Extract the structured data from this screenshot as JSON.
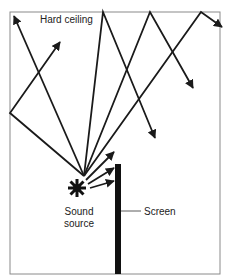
{
  "diagram": {
    "labels": {
      "ceiling": "Hard ceiling",
      "source_line1": "Sound",
      "source_line2": "source",
      "screen": "Screen"
    },
    "elements": {
      "room_box": {
        "x": 10,
        "y": 12,
        "w": 210,
        "h": 262
      },
      "screen_bar": {
        "x": 115,
        "y": 164,
        "w": 6,
        "h": 110
      },
      "sound_source": {
        "cx": 77,
        "cy": 188
      },
      "ray_origin": {
        "x": 84,
        "y": 176
      }
    },
    "rays": [
      {
        "path": "origin -> ceiling corner",
        "end_arrow": [
          14,
          16
        ]
      },
      {
        "path": "origin -> left wall (10,113) -> up-right",
        "end_arrow": [
          60,
          42
        ]
      },
      {
        "path": "origin -> ceiling (103,12) -> down-right",
        "end_arrow": [
          155,
          138
        ]
      },
      {
        "path": "origin -> ceiling (150,12) -> down-right",
        "end_arrow": [
          193,
          88
        ]
      },
      {
        "path": "origin -> ceiling (201,12) -> down-right",
        "end_arrow": [
          222,
          27
        ]
      },
      {
        "path": "origin -> screen",
        "end_arrow": [
          114,
          152
        ]
      },
      {
        "path": "origin -> screen",
        "end_arrow": [
          114,
          168
        ]
      },
      {
        "path": "origin -> screen",
        "end_arrow": [
          114,
          181
        ]
      }
    ],
    "colors": {
      "line": "#1a1a1a",
      "box": "#8a8a8a",
      "text": "#222222"
    }
  }
}
